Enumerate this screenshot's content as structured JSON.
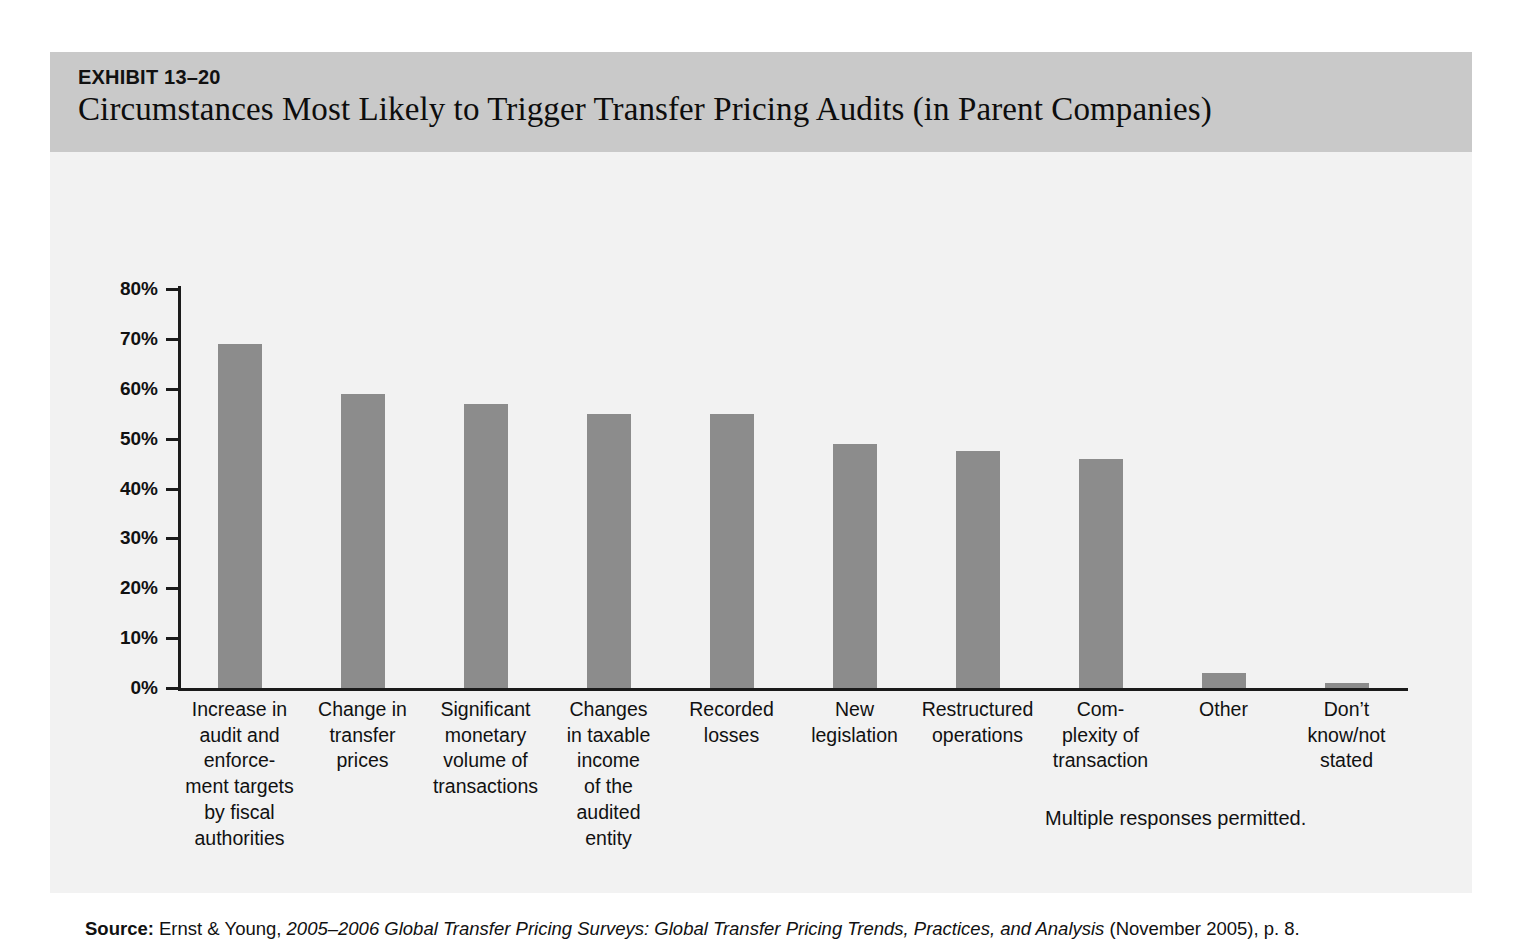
{
  "exhibit": {
    "number": "EXHIBIT 13–20",
    "title": "Circumstances Most Likely to Trigger Transfer Pricing Audits (in Parent Companies)"
  },
  "note": "Multiple responses permitted.",
  "source": {
    "label": "Source:",
    "publisher": " Ernst & Young, ",
    "italic_title": "2005–2006 Global Transfer Pricing Surveys: Global Transfer Pricing Trends, Practices, and Analysis",
    "tail": " (November 2005), p. 8."
  },
  "colors": {
    "bar_fill": "#8c8c8c",
    "header_band": "#c9c9c9",
    "plot_background": "#f2f2f2",
    "axis": "#1b1b1b"
  },
  "chart_data": {
    "type": "bar",
    "title": "Circumstances Most Likely to Trigger Transfer Pricing Audits (in Parent Companies)",
    "xlabel": "",
    "ylabel": "",
    "ylim": [
      0,
      80
    ],
    "grid": false,
    "legend": "none",
    "ytick_labels": [
      "80%",
      "70%",
      "60%",
      "50%",
      "40%",
      "30%",
      "20%",
      "10%",
      "0%"
    ],
    "ytick_values": [
      80,
      70,
      60,
      50,
      40,
      30,
      20,
      10,
      0
    ],
    "categories": [
      "Increase in\naudit and\nenforce-\nment targets\nby fiscal\nauthorities",
      "Change in\ntransfer\nprices",
      "Significant\nmonetary\nvolume of\ntransactions",
      "Changes\nin taxable\nincome\nof the\naudited\nentity",
      "Recorded\nlosses",
      "New\nlegislation",
      "Restructured\noperations",
      "Com-\nplexity of\ntransaction",
      "Other",
      "Don’t\nknow/not\nstated"
    ],
    "values": [
      69,
      59,
      57,
      55,
      55,
      49,
      47.5,
      46,
      3,
      1
    ],
    "annotation": "Multiple responses permitted."
  }
}
